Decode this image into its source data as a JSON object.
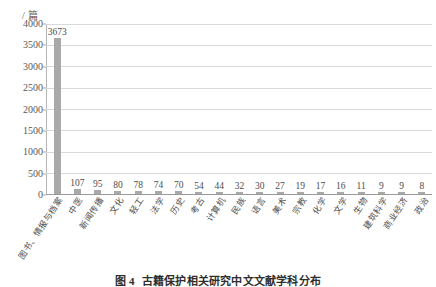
{
  "figure": {
    "unit_label": "/ 篇",
    "caption_number": "图 4",
    "caption_text": "古籍保护相关研究中文文献学科分布"
  },
  "chart_data": {
    "type": "bar",
    "title": "古籍保护相关研究中文文献学科分布",
    "xlabel": "",
    "ylabel": "/ 篇",
    "ylim": [
      0,
      4000
    ],
    "ytick_step": 500,
    "grid": true,
    "legend": "none",
    "orientation": "vertical",
    "bar_color": "#a9a9a9",
    "ytick_labels": [
      "4000",
      "3500",
      "3000",
      "2500",
      "2000",
      "1500",
      "1000",
      "500",
      "0"
    ],
    "categories": [
      "图书、情报与档案",
      "中医",
      "新闻传播",
      "文化",
      "轻工",
      "法学",
      "历史",
      "考古",
      "计算机",
      "民族",
      "语言",
      "美术",
      "宗教",
      "化学",
      "文学",
      "生物",
      "建筑科学",
      "商业经济",
      "政治"
    ],
    "values": [
      3673,
      107,
      95,
      80,
      78,
      74,
      70,
      54,
      44,
      32,
      30,
      27,
      19,
      17,
      16,
      11,
      9,
      9,
      8
    ],
    "value_labels": [
      "3673",
      "107",
      "95",
      "80",
      "78",
      "74",
      "70",
      "54",
      "44",
      "32",
      "30",
      "27",
      "19",
      "17",
      "16",
      "11",
      "9",
      "9",
      "8"
    ]
  }
}
